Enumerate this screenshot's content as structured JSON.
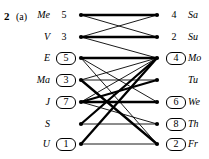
{
  "figure": {
    "number": "2",
    "part": "(a)",
    "caption_number_name": "figure-number",
    "left_column": [
      {
        "name": "Me",
        "value": "5",
        "boxed": false
      },
      {
        "name": "V",
        "value": "3",
        "boxed": false
      },
      {
        "name": "E",
        "value": "5",
        "boxed": true
      },
      {
        "name": "Ma",
        "value": "3",
        "boxed": true
      },
      {
        "name": "J",
        "value": "7",
        "boxed": true
      },
      {
        "name": "S",
        "value": "",
        "boxed": false
      },
      {
        "name": "U",
        "value": "1",
        "boxed": true
      }
    ],
    "right_column": [
      {
        "name": "Sa",
        "value": "4",
        "boxed": false
      },
      {
        "name": "Su",
        "value": "2",
        "boxed": false
      },
      {
        "name": "Mo",
        "value": "4",
        "boxed": true
      },
      {
        "name": "Tu",
        "value": "",
        "boxed": false
      },
      {
        "name": "We",
        "value": "6",
        "boxed": true
      },
      {
        "name": "Th",
        "value": "8",
        "boxed": true
      },
      {
        "name": "Fr",
        "value": "2",
        "boxed": true
      }
    ],
    "edges": [
      {
        "from": 0,
        "to": 0,
        "weight": "thick"
      },
      {
        "from": 0,
        "to": 1,
        "weight": "thin"
      },
      {
        "from": 1,
        "to": 0,
        "weight": "thin"
      },
      {
        "from": 1,
        "to": 1,
        "weight": "thick"
      },
      {
        "from": 1,
        "to": 2,
        "weight": "thin"
      },
      {
        "from": 2,
        "to": 2,
        "weight": "thick"
      },
      {
        "from": 2,
        "to": 4,
        "weight": "thin"
      },
      {
        "from": 2,
        "to": 6,
        "weight": "thin"
      },
      {
        "from": 3,
        "to": 2,
        "weight": "thin"
      },
      {
        "from": 3,
        "to": 3,
        "weight": "thin"
      },
      {
        "from": 3,
        "to": 6,
        "weight": "thick"
      },
      {
        "from": 4,
        "to": 2,
        "weight": "thin"
      },
      {
        "from": 4,
        "to": 3,
        "weight": "thick"
      },
      {
        "from": 4,
        "to": 4,
        "weight": "thick"
      },
      {
        "from": 4,
        "to": 5,
        "weight": "thin"
      },
      {
        "from": 5,
        "to": 2,
        "weight": "thick"
      },
      {
        "from": 5,
        "to": 5,
        "weight": "thin"
      },
      {
        "from": 6,
        "to": 2,
        "weight": "thick"
      },
      {
        "from": 6,
        "to": 6,
        "weight": "thin"
      }
    ],
    "geometry": {
      "left_node_x": 81,
      "right_node_x": 157,
      "row_ys": [
        15,
        37,
        58,
        80,
        102,
        124,
        144
      ],
      "node_radius": 2.1,
      "thick_width": 2.3,
      "thin_width": 0.9,
      "stroke_color": "#000000"
    }
  }
}
